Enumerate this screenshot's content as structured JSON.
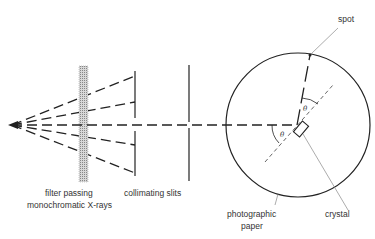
{
  "diagram": {
    "labels": {
      "spot": "spot",
      "filter_line1": "filter passing",
      "filter_line2": "monochromatic X-rays",
      "slits": "collimating slits",
      "paper_line1": "photographic",
      "paper_line2": "paper",
      "crystal": "crystal",
      "angle_incident": "θ",
      "angle_diffracted": "θ"
    },
    "colors": {
      "line": "#222222",
      "leader": "#888888",
      "filter_fill": "#bbbbbb"
    },
    "components": [
      {
        "id": "source",
        "name": "X-ray source",
        "x": 12,
        "y": 125
      },
      {
        "id": "filter",
        "name": "filter passing monochromatic X-rays",
        "x": [
          79,
          88
        ],
        "y": [
          66,
          182
        ]
      },
      {
        "id": "slit1",
        "name": "collimating slit 1",
        "x": 135
      },
      {
        "id": "slit2",
        "name": "collimating slit 2",
        "x": 189
      },
      {
        "id": "paper",
        "name": "photographic paper",
        "shape": "circle",
        "cx": 298,
        "cy": 125,
        "r": 72
      },
      {
        "id": "crystal",
        "name": "crystal",
        "cx": 300,
        "cy": 130
      },
      {
        "id": "spot",
        "name": "spot",
        "x": 310,
        "y": 55
      }
    ],
    "rays_from_source": 5
  }
}
